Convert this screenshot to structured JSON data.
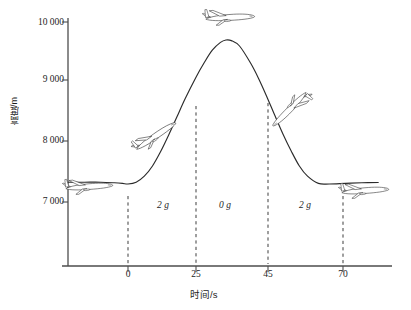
{
  "chart_data": {
    "type": "line",
    "title": "",
    "xlabel": "时间/s",
    "ylabel": "高度/m",
    "xticks": [
      0,
      25,
      45,
      70
    ],
    "xtick_labels": [
      "0",
      "25",
      "45",
      "70"
    ],
    "yticks": [
      7000,
      8000,
      9000,
      10000
    ],
    "ytick_labels": [
      "7 000",
      "8 000",
      "9 000",
      "10 000"
    ],
    "ylim": [
      6600,
      10150
    ],
    "xlim": [
      -22,
      92
    ],
    "grid": false,
    "legend": null,
    "series": [
      {
        "name": "飞行高度",
        "x": [
          -22,
          -16,
          -10,
          -5,
          -2,
          0,
          3,
          6,
          9,
          12,
          15,
          18,
          21,
          25,
          28,
          31,
          34,
          36,
          38,
          41,
          45,
          48,
          51,
          54,
          57,
          60,
          63,
          66,
          70,
          74,
          80,
          86,
          92
        ],
        "y": [
          7330,
          7330,
          7330,
          7320,
          7310,
          7300,
          7330,
          7430,
          7600,
          7840,
          8120,
          8420,
          8720,
          9080,
          9320,
          9530,
          9660,
          9700,
          9690,
          9600,
          9320,
          9060,
          8760,
          8440,
          8130,
          7850,
          7600,
          7430,
          7310,
          7300,
          7310,
          7320,
          7325
        ]
      }
    ],
    "annotations": [
      {
        "label": "2 g",
        "x": 12,
        "y": 7060
      },
      {
        "label": "0 g",
        "x": 35,
        "y": 7060
      },
      {
        "label": "2 g",
        "x": 57,
        "y": 7060
      }
    ],
    "vlines": [
      0,
      25,
      45,
      70
    ],
    "markers": [
      {
        "name": "airplane-level-left",
        "x": -13,
        "y": 7460,
        "attitude": "level"
      },
      {
        "name": "airplane-climbing",
        "x": 12,
        "y": 8380,
        "attitude": "climb"
      },
      {
        "name": "airplane-apex",
        "x": 36,
        "y": 10000,
        "attitude": "level"
      },
      {
        "name": "airplane-descending",
        "x": 58,
        "y": 8620,
        "attitude": "dive"
      },
      {
        "name": "airplane-level-right",
        "x": 81,
        "y": 7440,
        "attitude": "level"
      }
    ]
  }
}
